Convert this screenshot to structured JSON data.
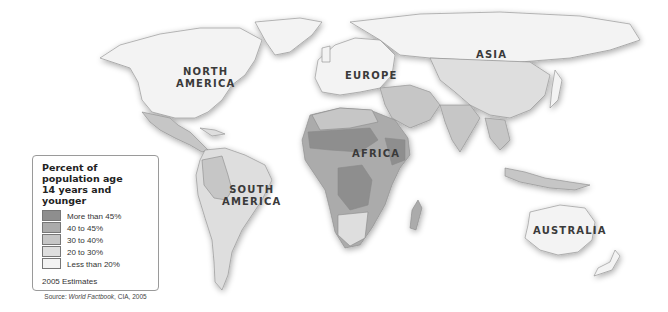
{
  "legend": {
    "title_line1": "Percent of population age",
    "title_line2": "14 years and younger",
    "items": [
      {
        "label": "More than 45%",
        "color": "#8e8e8e"
      },
      {
        "label": "40 to 45%",
        "color": "#ababab"
      },
      {
        "label": "30 to 40%",
        "color": "#c6c6c6"
      },
      {
        "label": "20 to 30%",
        "color": "#dedede"
      },
      {
        "label": "Less than 20%",
        "color": "#f3f3f3"
      }
    ],
    "estimates": "2005 Estimates",
    "source_prefix": "Source: ",
    "source_title": "World Factbook",
    "source_suffix": ", CIA, 2005"
  },
  "continents": {
    "north_america_1": "NORTH",
    "north_america_2": "AMERICA",
    "south_america_1": "SOUTH",
    "south_america_2": "AMERICA",
    "europe": "EUROPE",
    "asia": "ASIA",
    "africa": "AFRICA",
    "australia": "AUSTRALIA"
  },
  "colors": {
    "more_than_45": "#8e8e8e",
    "40_to_45": "#ababab",
    "30_to_40": "#c6c6c6",
    "20_to_30": "#dedede",
    "less_than_20": "#f3f3f3",
    "ocean": "#ffffff",
    "border": "#8a8a8a"
  }
}
